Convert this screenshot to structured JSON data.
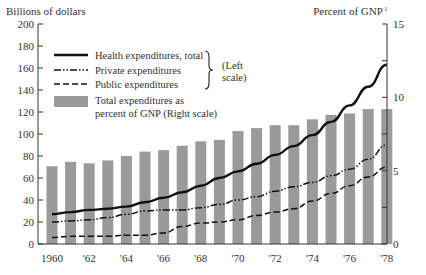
{
  "chart_data": {
    "type": "bar+line",
    "title": "",
    "left_axis_title": "Billions of dollars",
    "right_axis_title": "Percent of GNP",
    "right_axis_title_superscript": "1",
    "left_ylim": [
      0,
      200
    ],
    "left_ticks": [
      0,
      20,
      40,
      60,
      80,
      100,
      120,
      140,
      160,
      180,
      200
    ],
    "right_ylim": [
      0,
      15
    ],
    "right_ticks": [
      0,
      5,
      10,
      15
    ],
    "right_minor_ticks": [
      2.5,
      7.5,
      12.5
    ],
    "x": [
      1960,
      1961,
      1962,
      1963,
      1964,
      1965,
      1966,
      1967,
      1968,
      1969,
      1970,
      1971,
      1972,
      1973,
      1974,
      1975,
      1976,
      1977,
      1978
    ],
    "x_tick_labels": [
      {
        "year": 1960,
        "label": "1960"
      },
      {
        "year": 1962,
        "label": "'62"
      },
      {
        "year": 1964,
        "label": "'64"
      },
      {
        "year": 1966,
        "label": "'66"
      },
      {
        "year": 1968,
        "label": "'68"
      },
      {
        "year": 1970,
        "label": "'70"
      },
      {
        "year": 1972,
        "label": "'72"
      },
      {
        "year": 1974,
        "label": "'74"
      },
      {
        "year": 1976,
        "label": "'76"
      },
      {
        "year": 1978,
        "label": "'78"
      }
    ],
    "series": [
      {
        "name": "Total expenditures as percent of GNP (Right scale)",
        "kind": "bar",
        "axis": "right",
        "color": "#9a9a9a",
        "values": [
          5.3,
          5.6,
          5.5,
          5.7,
          6.0,
          6.3,
          6.4,
          6.7,
          7.0,
          7.1,
          7.7,
          7.9,
          8.1,
          8.1,
          8.5,
          8.8,
          8.9,
          9.2,
          9.2
        ]
      },
      {
        "name": "Health expenditures, total",
        "kind": "line",
        "axis": "left",
        "style": "solid",
        "color": "#111111",
        "values": [
          27,
          29,
          31,
          32,
          34,
          38,
          42,
          47,
          53,
          60,
          66,
          73,
          81,
          89,
          99,
          111,
          126,
          143,
          163
        ]
      },
      {
        "name": "Private expenditures",
        "kind": "line",
        "axis": "left",
        "style": "dash-dot",
        "color": "#111111",
        "values": [
          20,
          21,
          22,
          24,
          27,
          30,
          31,
          31,
          33,
          36,
          40,
          43,
          48,
          52,
          56,
          62,
          68,
          77,
          90
        ]
      },
      {
        "name": "Public expenditures",
        "kind": "line",
        "axis": "left",
        "style": "dashed",
        "color": "#111111",
        "values": [
          6,
          7,
          7,
          7,
          8,
          8,
          10,
          16,
          19,
          20,
          22,
          26,
          29,
          32,
          39,
          46,
          53,
          61,
          70
        ]
      }
    ],
    "legend": {
      "items": [
        {
          "label": "Health expenditures, total",
          "style": "solid"
        },
        {
          "label": "Private expenditures",
          "style": "dash-dot"
        },
        {
          "label": "Public expenditures",
          "style": "dashed"
        },
        {
          "label": "Total expenditures as",
          "label2": "percent of GNP (Right scale)",
          "style": "bar"
        }
      ],
      "bracket_label_1": "(Left",
      "bracket_label_2": "scale)",
      "position": "upper-left"
    },
    "grid": false
  }
}
